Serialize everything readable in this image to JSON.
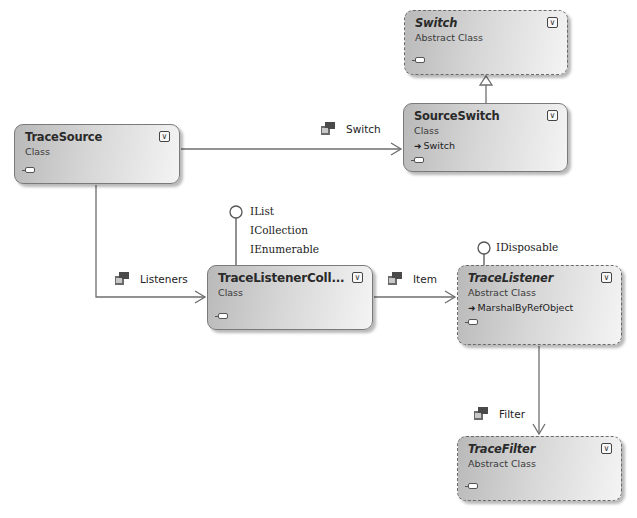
{
  "diagram": {
    "type": "class-diagram",
    "colors": {
      "shape_fill_dark": "#b9b9b9",
      "shape_fill_light": "#f4f4f4",
      "border": "#7a7a7a",
      "line": "#6e6e6e",
      "background": "#ffffff"
    },
    "shapes": {
      "switch": {
        "name": "Switch",
        "kind": "Abstract Class",
        "abstract": true
      },
      "source_switch": {
        "name": "SourceSwitch",
        "kind": "Class",
        "base": "Switch",
        "abstract": false
      },
      "trace_source": {
        "name": "TraceSource",
        "kind": "Class",
        "abstract": false
      },
      "trace_listener_collection": {
        "name": "TraceListenerColl...",
        "kind": "Class",
        "abstract": false
      },
      "trace_listener": {
        "name": "TraceListener",
        "kind": "Abstract Class",
        "base": "MarshalByRefObject",
        "abstract": true
      },
      "trace_filter": {
        "name": "TraceFilter",
        "kind": "Abstract Class",
        "abstract": true
      }
    },
    "toggle_glyph": "¥",
    "base_arrow_glyph": "➜",
    "associations": {
      "switch": "Switch",
      "listeners": "Listeners",
      "item": "Item",
      "filter": "Filter"
    },
    "interfaces": {
      "trace_listener_collection": [
        "IList",
        "ICollection",
        "IEnumerable"
      ],
      "trace_listener": [
        "IDisposable"
      ]
    },
    "inheritance": [
      {
        "from": "SourceSwitch",
        "to": "Switch"
      }
    ]
  }
}
